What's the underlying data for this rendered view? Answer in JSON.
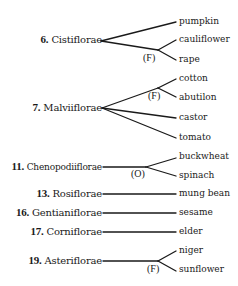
{
  "diagram": {
    "type": "tree",
    "groups": [
      {
        "number": "6.",
        "name": "Cistiflorae",
        "y": 40,
        "crops": [
          {
            "label": "pumpkin",
            "y": 22
          },
          {
            "label": "cauliflower",
            "y": 40
          },
          {
            "label": "rape",
            "y": 60
          }
        ],
        "family_node": {
          "label": "(F)",
          "groups_crops": [
            "cauliflower",
            "rape"
          ]
        }
      },
      {
        "number": "7.",
        "name": "Malviiflorae",
        "y": 108,
        "crops": [
          {
            "label": "cotton",
            "y": 78
          },
          {
            "label": "abutilon",
            "y": 97
          },
          {
            "label": "castor",
            "y": 118
          },
          {
            "label": "tomato",
            "y": 138
          }
        ],
        "family_node": {
          "label": "(F)",
          "groups_crops": [
            "cotton",
            "abutilon"
          ]
        }
      },
      {
        "number": "11.",
        "name": "Chenopodiiflorae",
        "y": 167,
        "crops": [
          {
            "label": "buckwheat",
            "y": 158
          },
          {
            "label": "spinach",
            "y": 176
          }
        ],
        "family_node": {
          "label": "(O)",
          "groups_crops": [
            "buckwheat",
            "spinach"
          ]
        }
      },
      {
        "number": "13.",
        "name": "Rosiflorae",
        "y": 194,
        "crops": [
          {
            "label": "mung bean",
            "y": 194
          }
        ]
      },
      {
        "number": "16.",
        "name": "Gentianiflorae",
        "y": 213,
        "crops": [
          {
            "label": "sesame",
            "y": 213
          }
        ]
      },
      {
        "number": "17.",
        "name": "Corniflorae",
        "y": 232,
        "crops": [
          {
            "label": "elder",
            "y": 232
          }
        ]
      },
      {
        "number": "19.",
        "name": "Asteriflorae",
        "y": 261,
        "crops": [
          {
            "label": "niger",
            "y": 251
          },
          {
            "label": "sunflower",
            "y": 270
          }
        ],
        "family_node": {
          "label": "(F)",
          "groups_crops": [
            "niger",
            "sunflower"
          ]
        }
      }
    ],
    "line_color": "#1a1a1a"
  }
}
